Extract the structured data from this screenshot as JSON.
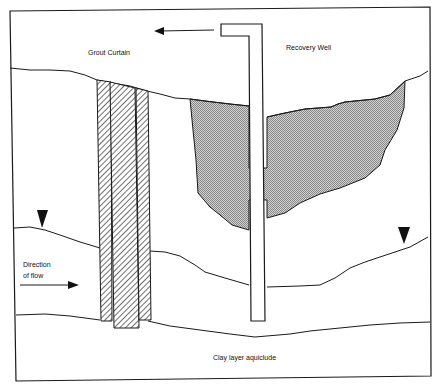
{
  "diagram": {
    "type": "cross-section",
    "title": "",
    "colors": {
      "line": "#1a1a1a",
      "background": "#ffffff",
      "plume_fill": "#b8b8b8",
      "hatch": "#333333"
    },
    "labels": {
      "grout_curtain": "Grout Curtain",
      "recovery_well": "Recovery Well",
      "direction_of_flow_line1": "Direction",
      "direction_of_flow_line2": "of flow",
      "clay_layer": "Clay layer aquiclude"
    },
    "elements": [
      {
        "id": "ground-surface",
        "kind": "line",
        "description": "Ground surface"
      },
      {
        "id": "grout-curtain",
        "kind": "hatched-barrier",
        "panels": 3
      },
      {
        "id": "recovery-well",
        "kind": "pipe",
        "discharge_arrow": "left"
      },
      {
        "id": "contaminant-plume",
        "kind": "stippled-region"
      },
      {
        "id": "water-table",
        "kind": "line",
        "markers": 2
      },
      {
        "id": "clay-layer-top",
        "kind": "line"
      },
      {
        "id": "flow-arrow",
        "kind": "arrow",
        "direction": "right"
      }
    ]
  }
}
